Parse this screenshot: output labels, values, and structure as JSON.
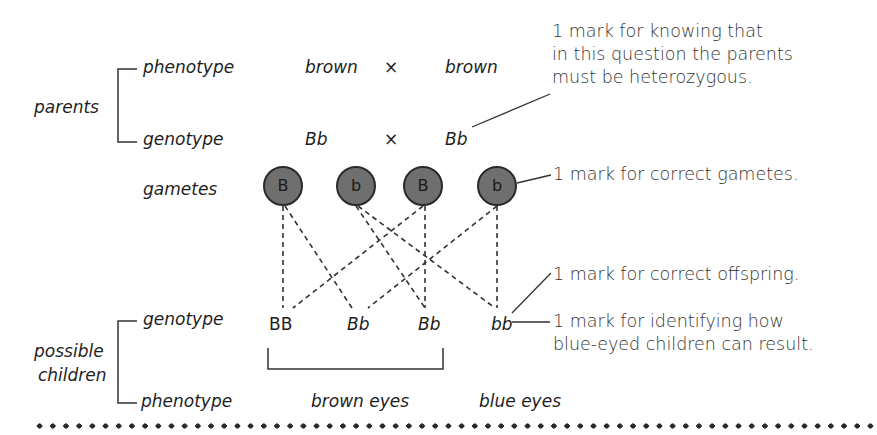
{
  "parents": {
    "label": "parents",
    "phenotype_label": "phenotype",
    "genotype_label": "genotype",
    "phenotype": {
      "left": "brown",
      "cross": "×",
      "right": "brown"
    },
    "genotype": {
      "left": "Bb",
      "cross": "×",
      "right": "Bb"
    }
  },
  "gametes": {
    "label": "gametes",
    "items": [
      "B",
      "b",
      "B",
      "b"
    ],
    "fill_color": "#6f6f6f"
  },
  "children": {
    "label_line1": "possible",
    "label_line2": "children",
    "genotype_label": "genotype",
    "phenotype_label": "phenotype",
    "genotypes": [
      "BB",
      "Bb",
      "Bb",
      "bb"
    ],
    "phenotypes": {
      "brown": "brown eyes",
      "blue": "blue eyes"
    }
  },
  "annotations": {
    "heterozygous": [
      "1 mark for knowing that",
      "in this question the parents",
      "must be heterozygous."
    ],
    "gametes": "1 mark for correct gametes.",
    "offspring": "1 mark for correct offspring.",
    "blue_eyed": [
      "1 mark for identifying how",
      "blue-eyed children can result."
    ]
  }
}
